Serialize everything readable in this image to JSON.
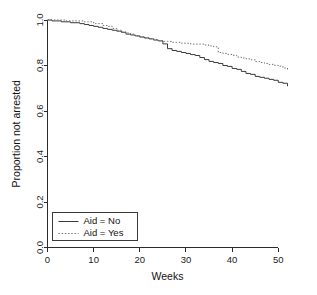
{
  "chart_data": {
    "type": "line",
    "title": "",
    "subtitle": "",
    "xlabel": "Weeks",
    "ylabel": "Proportion not arrested",
    "xlim": [
      0,
      52
    ],
    "ylim": [
      0,
      1
    ],
    "xticks": [
      0,
      10,
      20,
      30,
      40,
      50
    ],
    "xticklabels": [
      "0",
      "10",
      "20",
      "30",
      "40",
      "50"
    ],
    "yticks": [
      0.0,
      0.2,
      0.4,
      0.6,
      0.8,
      1.0
    ],
    "yticklabels": [
      "0.0",
      "0.2",
      "0.4",
      "0.6",
      "0.8",
      "1.0"
    ],
    "grid": false,
    "step": true,
    "legend_position": "bottom-left",
    "legend_entries": [
      "Aid = No",
      "Aid = Yes"
    ],
    "series": [
      {
        "name": "Aid = No",
        "style": "solid",
        "color": "#3a3a3a",
        "x": [
          0,
          1,
          3,
          5,
          7,
          8,
          9,
          10,
          11,
          12,
          13,
          14,
          15,
          16,
          17,
          18,
          19,
          20,
          21,
          22,
          23,
          24,
          25,
          26,
          27,
          28,
          29,
          30,
          31,
          32,
          33,
          34,
          35,
          36,
          37,
          38,
          39,
          40,
          41,
          42,
          43,
          44,
          45,
          46,
          47,
          48,
          49,
          50,
          51,
          52
        ],
        "y": [
          1.0,
          0.996,
          0.992,
          0.988,
          0.984,
          0.98,
          0.976,
          0.972,
          0.968,
          0.963,
          0.959,
          0.955,
          0.951,
          0.946,
          0.938,
          0.934,
          0.93,
          0.925,
          0.921,
          0.917,
          0.912,
          0.908,
          0.895,
          0.874,
          0.866,
          0.862,
          0.857,
          0.853,
          0.848,
          0.844,
          0.835,
          0.826,
          0.818,
          0.813,
          0.809,
          0.8,
          0.796,
          0.787,
          0.783,
          0.774,
          0.765,
          0.761,
          0.752,
          0.748,
          0.744,
          0.739,
          0.735,
          0.726,
          0.722,
          0.709
        ]
      },
      {
        "name": "Aid = Yes",
        "style": "dotted",
        "color": "#6d6d6d",
        "x": [
          0,
          2,
          4,
          6,
          8,
          10,
          12,
          13,
          14,
          15,
          16,
          17,
          18,
          19,
          20,
          21,
          22,
          23,
          24,
          25,
          26,
          27,
          28,
          29,
          30,
          31,
          32,
          33,
          34,
          35,
          36,
          37,
          38,
          39,
          40,
          41,
          42,
          43,
          44,
          45,
          46,
          47,
          48,
          49,
          50,
          51,
          52
        ],
        "y": [
          1.0,
          1.0,
          0.996,
          0.996,
          0.992,
          0.984,
          0.976,
          0.972,
          0.963,
          0.955,
          0.947,
          0.943,
          0.938,
          0.93,
          0.926,
          0.922,
          0.918,
          0.914,
          0.91,
          0.906,
          0.906,
          0.902,
          0.902,
          0.898,
          0.898,
          0.894,
          0.894,
          0.894,
          0.89,
          0.886,
          0.882,
          0.857,
          0.853,
          0.849,
          0.845,
          0.837,
          0.833,
          0.829,
          0.825,
          0.817,
          0.813,
          0.809,
          0.805,
          0.801,
          0.797,
          0.789,
          0.781
        ]
      }
    ]
  },
  "axes": {
    "x_title": "Weeks",
    "y_title": "Proportion not arrested"
  },
  "legend": {
    "items": [
      {
        "label": "Aid = No",
        "style": "solid"
      },
      {
        "label": "Aid = Yes",
        "style": "dotted"
      }
    ]
  }
}
